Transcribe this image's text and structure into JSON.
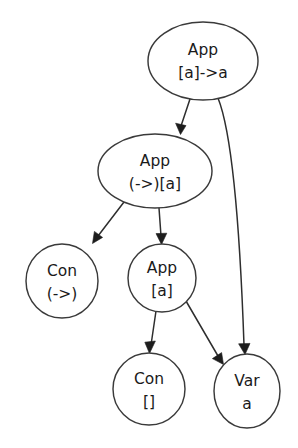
{
  "diagram": {
    "type": "directed-graph",
    "background_color": "#ffffff",
    "node_fill": "#ffffff",
    "node_stroke": "#3a3a3a",
    "edge_color": "#2e2e2e",
    "text_color": "#1a1a1a",
    "nodes": [
      {
        "id": "app-root",
        "shape": "ellipse",
        "line1": "App",
        "line2": "[a]->a",
        "cx": 203,
        "cy": 61,
        "rx": 55,
        "ry": 39
      },
      {
        "id": "app-arrow-list",
        "shape": "ellipse",
        "line1": "App",
        "line2": "(->)[a]",
        "cx": 155,
        "cy": 171,
        "rx": 57,
        "ry": 37
      },
      {
        "id": "con-arrow",
        "shape": "ellipse",
        "line1": "Con",
        "line2": "(->)",
        "cx": 62,
        "cy": 281,
        "rx": 36,
        "ry": 37
      },
      {
        "id": "app-list",
        "shape": "ellipse",
        "line1": "App",
        "line2": "[a]",
        "cx": 162,
        "cy": 278,
        "rx": 34,
        "ry": 34
      },
      {
        "id": "con-nil",
        "shape": "ellipse",
        "line1": "Con",
        "line2": "[]",
        "cx": 149,
        "cy": 389,
        "rx": 36,
        "ry": 36
      },
      {
        "id": "var-a",
        "shape": "ellipse",
        "line1": "Var",
        "line2": "a",
        "cx": 247,
        "cy": 391,
        "rx": 33,
        "ry": 37
      }
    ],
    "edges": [
      {
        "id": "e1",
        "from": "app-root",
        "to": "app-arrow-list",
        "arrow": "normal"
      },
      {
        "id": "e2",
        "from": "app-root",
        "to": "var-a",
        "arrow": "normal"
      },
      {
        "id": "e3",
        "from": "app-arrow-list",
        "to": "con-arrow",
        "arrow": "normal"
      },
      {
        "id": "e4",
        "from": "app-arrow-list",
        "to": "app-list",
        "arrow": "normal"
      },
      {
        "id": "e5",
        "from": "app-list",
        "to": "con-nil",
        "arrow": "normal"
      },
      {
        "id": "e6",
        "from": "app-list",
        "to": "var-a",
        "arrow": "normal"
      }
    ]
  }
}
